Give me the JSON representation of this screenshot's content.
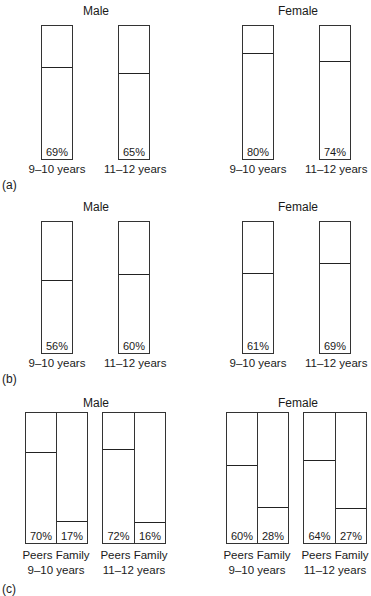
{
  "figure": {
    "panels": [
      {
        "label": "(a)",
        "groups": [
          {
            "title": "Male",
            "bars": [
              {
                "category": "9–10 years",
                "value": 69,
                "text": "69%"
              },
              {
                "category": "11–12 years",
                "value": 65,
                "text": "65%"
              }
            ]
          },
          {
            "title": "Female",
            "bars": [
              {
                "category": "9–10 years",
                "value": 80,
                "text": "80%"
              },
              {
                "category": "11–12 years",
                "value": 74,
                "text": "74%"
              }
            ]
          }
        ]
      },
      {
        "label": "(b)",
        "groups": [
          {
            "title": "Male",
            "bars": [
              {
                "category": "9–10 years",
                "value": 56,
                "text": "56%"
              },
              {
                "category": "11–12 years",
                "value": 60,
                "text": "60%"
              }
            ]
          },
          {
            "title": "Female",
            "bars": [
              {
                "category": "9–10 years",
                "value": 61,
                "text": "61%"
              },
              {
                "category": "11–12 years",
                "value": 69,
                "text": "69%"
              }
            ]
          }
        ]
      },
      {
        "label": "(c)",
        "groups": [
          {
            "title": "Male",
            "pairs": [
              {
                "age": "9–10 years",
                "sublabel": "Peers Family",
                "bars": [
                  {
                    "category": "Peers",
                    "value": 70,
                    "text": "70%"
                  },
                  {
                    "category": "Family",
                    "value": 17,
                    "text": "17%"
                  }
                ]
              },
              {
                "age": "11–12 years",
                "sublabel": "Peers Family",
                "bars": [
                  {
                    "category": "Peers",
                    "value": 72,
                    "text": "72%"
                  },
                  {
                    "category": "Family",
                    "value": 16,
                    "text": "16%"
                  }
                ]
              }
            ]
          },
          {
            "title": "Female",
            "pairs": [
              {
                "age": "9–10 years",
                "sublabel": "Peers Family",
                "bars": [
                  {
                    "category": "Peers",
                    "value": 60,
                    "text": "60%"
                  },
                  {
                    "category": "Family",
                    "value": 28,
                    "text": "28%"
                  }
                ]
              },
              {
                "age": "11–12 years",
                "sublabel": "Peers Family",
                "bars": [
                  {
                    "category": "Peers",
                    "value": 64,
                    "text": "64%"
                  },
                  {
                    "category": "Family",
                    "value": 27,
                    "text": "27%"
                  }
                ]
              }
            ]
          }
        ]
      }
    ]
  },
  "chart_data": [
    {
      "type": "bar",
      "title": "(a)",
      "categories": [
        "9–10 years",
        "11–12 years"
      ],
      "series": [
        {
          "name": "Male",
          "values": [
            69,
            65
          ]
        },
        {
          "name": "Female",
          "values": [
            80,
            74
          ]
        }
      ],
      "xlabel": "",
      "ylabel": "",
      "ylim": [
        0,
        100
      ],
      "grid": false,
      "legend": "none",
      "annotations": [
        "Male",
        "Female"
      ]
    },
    {
      "type": "bar",
      "title": "(b)",
      "categories": [
        "9–10 years",
        "11–12 years"
      ],
      "series": [
        {
          "name": "Male",
          "values": [
            56,
            60
          ]
        },
        {
          "name": "Female",
          "values": [
            61,
            69
          ]
        }
      ],
      "xlabel": "",
      "ylabel": "",
      "ylim": [
        0,
        100
      ],
      "grid": false,
      "legend": "none",
      "annotations": [
        "Male",
        "Female"
      ]
    },
    {
      "type": "bar",
      "title": "(c)",
      "categories": [
        "Peers 9–10 years",
        "Family 9–10 years",
        "Peers 11–12 years",
        "Family 11–12 years"
      ],
      "series": [
        {
          "name": "Male",
          "values": [
            70,
            17,
            72,
            16
          ]
        },
        {
          "name": "Female",
          "values": [
            60,
            28,
            64,
            27
          ]
        }
      ],
      "xlabel": "",
      "ylabel": "",
      "ylim": [
        0,
        100
      ],
      "grid": false,
      "legend": "none",
      "annotations": [
        "Male",
        "Female"
      ]
    }
  ]
}
